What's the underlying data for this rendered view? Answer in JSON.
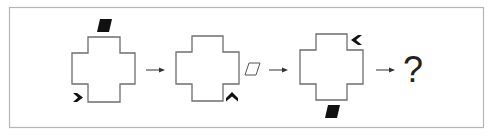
{
  "figure": {
    "type": "figural-sequence-puzzle",
    "frame_color": "#b5b5b5",
    "panels": [
      {
        "index": 1,
        "shape": "cross-outline",
        "markers": [
          {
            "kind": "filled-parallelogram",
            "position": "above-top-arm"
          },
          {
            "kind": "chevron-right",
            "position": "bottom-left-inner-corner"
          }
        ]
      },
      {
        "index": 2,
        "shape": "cross-outline",
        "markers": [
          {
            "kind": "chevron-up",
            "position": "bottom-right-inner-corner"
          },
          {
            "kind": "hollow-parallelogram",
            "position": "right-of-right-arm"
          }
        ]
      },
      {
        "index": 3,
        "shape": "cross-outline",
        "markers": [
          {
            "kind": "chevron-left",
            "position": "top-right-inner-corner"
          },
          {
            "kind": "filled-parallelogram",
            "position": "below-bottom-arm"
          }
        ]
      }
    ],
    "arrows": [
      "→",
      "→",
      "→"
    ],
    "answer_placeholder": "?"
  }
}
